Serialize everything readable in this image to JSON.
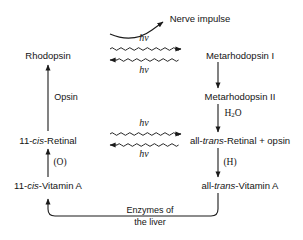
{
  "diagram": {
    "stroke_color": "#1a1a1a",
    "background_color": "#ffffff",
    "text_color": "#141414",
    "nodes": [
      {
        "id": "rhodopsin",
        "label": "Rhodopsin",
        "x": 48,
        "y": 55
      },
      {
        "id": "metarhodopsin1",
        "label": "Metarhodopsin I",
        "x": 240,
        "y": 55
      },
      {
        "id": "metarhodopsin2",
        "label": "Metarhodopsin II",
        "x": 240,
        "y": 96
      },
      {
        "id": "cis-retinal",
        "label": "11-cis-Retinal",
        "x": 48,
        "y": 140,
        "pre": "11-",
        "ital": "cis",
        "post": "-Retinal"
      },
      {
        "id": "trans-retinal",
        "label": "all-trans-Retinal + opsin",
        "x": 240,
        "y": 140,
        "pre": "all-",
        "ital": "trans",
        "post": "-Retinal + opsin"
      },
      {
        "id": "cis-vitamin-a",
        "label": "11-cis-Vitamin A",
        "x": 48,
        "y": 185,
        "pre": "11-",
        "ital": "cis",
        "post": "-Vitamin A"
      },
      {
        "id": "trans-vitamin-a",
        "label": "all-trans-Vitamin A",
        "x": 240,
        "y": 185,
        "pre": "all-",
        "ital": "trans",
        "post": "-Vitamin A"
      },
      {
        "id": "nerve-impulse",
        "label": "Nerve impulse",
        "x": 200,
        "y": 18
      }
    ],
    "edge_labels": [
      {
        "id": "photon-top-forward",
        "text": "hν",
        "x": 144,
        "y": 37,
        "style": "photon"
      },
      {
        "id": "photon-top-reverse",
        "text": "hν",
        "x": 144,
        "y": 69,
        "style": "photon"
      },
      {
        "id": "photon-bottom-forward",
        "text": "hν",
        "x": 144,
        "y": 122,
        "style": "photon"
      },
      {
        "id": "photon-bottom-reverse",
        "text": "hν",
        "x": 144,
        "y": 153,
        "style": "photon"
      },
      {
        "id": "opsin",
        "text": "Opsin",
        "x": 66,
        "y": 97,
        "style": "plain"
      },
      {
        "id": "oxidation",
        "text": "(O)",
        "x": 60,
        "y": 162,
        "style": "serif"
      },
      {
        "id": "hydrogenation",
        "text": "(H)",
        "x": 230,
        "y": 162,
        "style": "serif"
      },
      {
        "id": "water",
        "text": "H2O",
        "x": 233,
        "y": 114,
        "style": "serif",
        "formula": true
      },
      {
        "id": "enzymes-of-the-liver",
        "line1": "Enzymes of",
        "line2": "the liver",
        "x": 150,
        "y": 216,
        "style": "two-line"
      }
    ]
  }
}
